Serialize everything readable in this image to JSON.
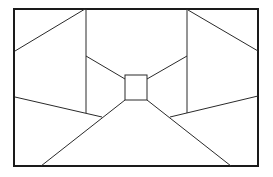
{
  "diagram": {
    "title": "",
    "colors": {
      "stroke": "#1a1a1a",
      "background": "#ffffff"
    },
    "frame": {
      "x": 14,
      "y": 9,
      "w": 244,
      "h": 157
    },
    "lines": [
      {
        "id": "left-upper-diagonal",
        "x1": 15,
        "y1": 51,
        "x2": 85,
        "y2": 9
      },
      {
        "id": "left-vertical",
        "x1": 86,
        "y1": 9,
        "x2": 86,
        "y2": 113
      },
      {
        "id": "left-inner-ceiling",
        "x1": 86,
        "y1": 56,
        "x2": 125,
        "y2": 79
      },
      {
        "id": "left-lower-diagonal",
        "x1": 15,
        "y1": 97,
        "x2": 102,
        "y2": 117
      },
      {
        "id": "left-floor-line",
        "x1": 41,
        "y1": 166,
        "x2": 125,
        "y2": 100
      },
      {
        "id": "right-upper-diagonal",
        "x1": 188,
        "y1": 10,
        "x2": 258,
        "y2": 51
      },
      {
        "id": "right-vertical",
        "x1": 187,
        "y1": 9,
        "x2": 187,
        "y2": 113
      },
      {
        "id": "right-inner-ceiling",
        "x1": 187,
        "y1": 56,
        "x2": 147,
        "y2": 79
      },
      {
        "id": "right-lower-diagonal",
        "x1": 258,
        "y1": 96,
        "x2": 170,
        "y2": 117
      },
      {
        "id": "right-floor-line",
        "x1": 231,
        "y1": 166,
        "x2": 147,
        "y2": 100
      }
    ],
    "vanishing_square": {
      "x": 125,
      "y": 75,
      "w": 22,
      "h": 25
    }
  }
}
